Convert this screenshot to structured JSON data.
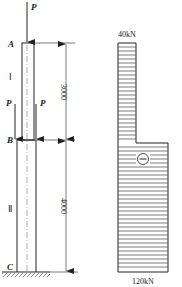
{
  "figure": {
    "column": {
      "points": {
        "top": "A",
        "middle": "B",
        "base": "C"
      },
      "segments": {
        "upper": "Ⅰ",
        "lower": "Ⅱ"
      },
      "loads": {
        "top_load": "P",
        "left_load": "P",
        "right_load": "P"
      },
      "dimensions": {
        "upper_length": "3000",
        "lower_length": "4000"
      }
    },
    "axial_force_diagram": {
      "top_value": "40kN",
      "bottom_value": "120kN",
      "sign": "−"
    }
  },
  "colors": {
    "line": "#222222",
    "hatch": "#333333",
    "background": "#ffffff"
  }
}
